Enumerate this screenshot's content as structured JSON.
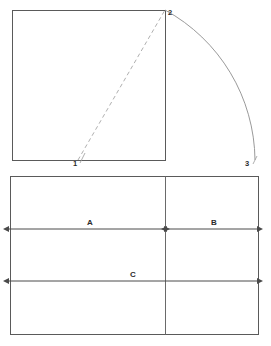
{
  "figure": {
    "type": "geometric-construction",
    "background_color": "#ffffff",
    "stroke_color": "#555555",
    "light_stroke_color": "#b4b4b4",
    "label_color": "#2b2b2b",
    "square": {
      "x": 12,
      "y": 10,
      "width": 153,
      "height": 150
    },
    "rectangle": {
      "x": 10,
      "y": 176,
      "width": 248,
      "height": 158,
      "divider_x": 165
    },
    "vertices": [
      {
        "id": "p1",
        "label": "1",
        "x": 78,
        "y": 160,
        "label_x": 73,
        "label_y": 166
      },
      {
        "id": "p2",
        "label": "2",
        "x": 165,
        "y": 10,
        "label_x": 168,
        "label_y": 13
      },
      {
        "id": "p3",
        "label": "3",
        "x": 255,
        "y": 160,
        "label_x": 246,
        "label_y": 166
      }
    ],
    "diagonal": {
      "from": "p1",
      "to": "p2",
      "style": "dashed"
    },
    "arc": {
      "from": "p2",
      "to": "p3",
      "center": "p1",
      "style": "solid"
    },
    "dimensions": [
      {
        "id": "dim-a",
        "label": "A",
        "x1": 8,
        "x2": 165,
        "y": 229,
        "label_x": 90,
        "label_y": 225
      },
      {
        "id": "dim-b",
        "label": "B",
        "x1": 165,
        "x2": 258,
        "y": 229,
        "label_x": 214,
        "label_y": 225
      },
      {
        "id": "dim-c",
        "label": "C",
        "x1": 8,
        "x2": 258,
        "y": 281,
        "label_x": 133,
        "label_y": 277
      }
    ]
  }
}
